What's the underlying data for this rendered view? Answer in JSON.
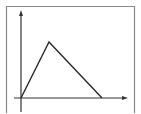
{
  "diagram": {
    "type": "line-sketch",
    "colors": {
      "background": "#ffffff",
      "frame": "#8a8a8a",
      "axes": "#333333",
      "curve": "#2a2a2a"
    },
    "frame": {
      "x": 6,
      "y": 6,
      "right": 135
    },
    "axes": {
      "origin": [
        21,
        98
      ],
      "y_axis": {
        "x": 21,
        "top": 11,
        "bottom": 112
      },
      "x_axis": {
        "y": 98,
        "left": 14,
        "right": 127
      }
    },
    "curve_points": [
      [
        21,
        98
      ],
      [
        49,
        42
      ],
      [
        102,
        98
      ]
    ]
  }
}
